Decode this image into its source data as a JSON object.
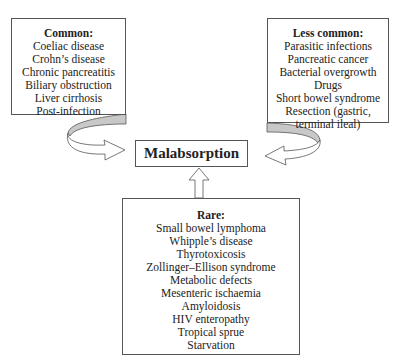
{
  "diagram": {
    "center": {
      "label": "Malabsorption"
    },
    "common": {
      "title": "Common:",
      "items": [
        "Coeliac disease",
        "Crohn’s disease",
        "Chronic pancreatitis",
        "Biliary obstruction",
        "Liver cirrhosis",
        "Post-infection"
      ]
    },
    "less_common": {
      "title": "Less common:",
      "items": [
        "Parasitic infections",
        "Pancreatic cancer",
        "Bacterial overgrowth",
        "Drugs",
        "Short bowel syndrome",
        "Resection (gastric,",
        "terminal ileal)"
      ]
    },
    "rare": {
      "title": "Rare:",
      "items": [
        "Small bowel lymphoma",
        "Whipple’s disease",
        "Thyrotoxicosis",
        "Zollinger–Ellison syndrome",
        "Metabolic defects",
        "Mesenteric ischaemia",
        "Amyloidosis",
        "HIV enteropathy",
        "Tropical sprue",
        "Starvation"
      ]
    },
    "colors": {
      "border": "#555555",
      "arrow_shade": "#c8c8c8",
      "background": "#ffffff"
    }
  }
}
